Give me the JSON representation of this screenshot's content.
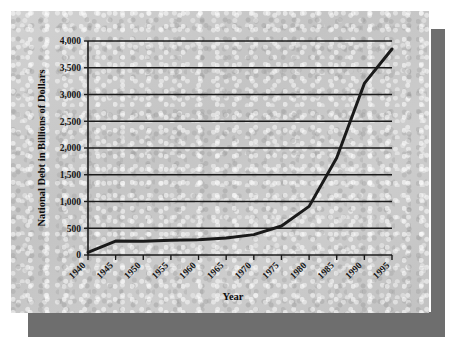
{
  "figure": {
    "medium": "scanned-printed-page",
    "paper_color": "#c9c9c9",
    "shadow_color": "#6e6e6e",
    "ink_color": "#161616"
  },
  "chart_data": {
    "type": "line",
    "title": "",
    "xlabel": "Year",
    "ylabel": "National Debt in Billions of Dollars",
    "x": [
      1940,
      1945,
      1950,
      1955,
      1960,
      1965,
      1970,
      1975,
      1980,
      1985,
      1990,
      1995
    ],
    "values": [
      50,
      260,
      257,
      274,
      286,
      317,
      381,
      542,
      909,
      1817,
      3207,
      3850
    ],
    "series": [
      {
        "name": "National Debt",
        "values": [
          50,
          260,
          257,
          274,
          286,
          317,
          381,
          542,
          909,
          1817,
          3207,
          3850
        ]
      }
    ],
    "xlim": [
      1940,
      1995
    ],
    "ylim": [
      0,
      4000
    ],
    "ytick_values": [
      0,
      500,
      1000,
      1500,
      2000,
      2500,
      3000,
      3500,
      4000
    ],
    "ytick_labels": [
      "0",
      "500",
      "1,000",
      "1,500",
      "2,000",
      "2,500",
      "3,000",
      "3,500",
      "4,000"
    ],
    "xtick_labels": [
      "1940",
      "1945",
      "1950",
      "1955",
      "1960",
      "1965",
      "1970",
      "1975",
      "1980",
      "1985",
      "1990",
      "1995"
    ],
    "grid": "horizontal",
    "legend": "none",
    "line_color": "#1a1a1a",
    "line_width": 3
  }
}
